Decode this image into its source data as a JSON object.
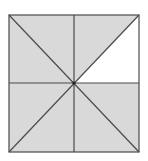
{
  "diagram": {
    "shaded_color": "#d9d9d9",
    "unshaded_color": "#ffffff",
    "line_color": "#4a4a4a",
    "total_regions": 8,
    "shaded_regions": 7,
    "unshaded_regions": 1
  }
}
